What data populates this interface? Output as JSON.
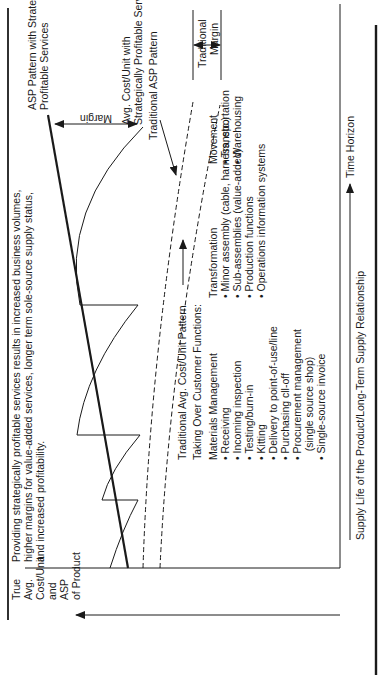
{
  "diagram": {
    "y_axis_label": [
      "True",
      "Avg.",
      "Cost/Unit",
      "and",
      "ASP",
      "of Product"
    ],
    "x_axis_label": "Supply Life of the Product/Long-Term Supply Relationship",
    "time_horizon_label": "Time Horizon",
    "summary_text": [
      "Providing strategically profitable services results in increased business volumes,",
      "higher margins for value-added services, longer term sole-source supply status,",
      "and increased profitability."
    ],
    "curve_labels": {
      "asp_strategic": [
        "ASP Pattern with Strategically",
        "Profitable Services"
      ],
      "cost_strategic": [
        "Avg. Cost/Unit with",
        "Strategically Profitable Services"
      ],
      "traditional_asp": "Traditional ASP Pattern",
      "traditional_cost": "Traditional Avg. Cost/Unit Pattern",
      "margin": "Margin",
      "traditional_margin": [
        "Traditional",
        "Margin"
      ]
    },
    "functions_heading": "Taking Over Customer Functions:",
    "materials_management": {
      "title": "Materials Management",
      "items": [
        "• Receiving",
        "• Incoming inspection",
        "• Testing/burn-in",
        "• Kitting",
        "• Delivery to point-of-use/line",
        "• Purchasing cll-off",
        "• Procurement management",
        "   (single source shop)",
        "• Single-source invoice"
      ]
    },
    "transformation": {
      "title": "Transformation",
      "items": [
        "• Minor assembly (cable, harness, etc.)",
        "• Sub-assemblies (value-added)",
        "• Production functions",
        "• Operations information systems"
      ]
    },
    "movement": {
      "title": "Movement",
      "items": [
        "• Transportation",
        "• Warehousing"
      ]
    },
    "colors": {
      "ink": "#1a1a1a",
      "background": "#ffffff"
    }
  }
}
